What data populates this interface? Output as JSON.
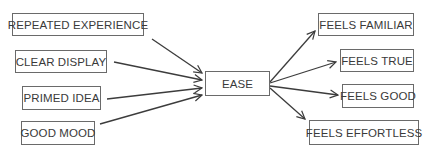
{
  "diagram": {
    "center": {
      "label": "EASE"
    },
    "causes": [
      {
        "label": "REPEATED EXPERIENCE"
      },
      {
        "label": "CLEAR DISPLAY"
      },
      {
        "label": "PRIMED IDEA"
      },
      {
        "label": "GOOD MOOD"
      }
    ],
    "effects": [
      {
        "label": "FEELS FAMILIAR"
      },
      {
        "label": "FEELS TRUE"
      },
      {
        "label": "FEELS GOOD"
      },
      {
        "label": "FEELS EFFORTLESS"
      }
    ],
    "colors": {
      "line": "#3c3c3c",
      "border": "#6a6a6a",
      "text": "#3a3a3a"
    }
  }
}
